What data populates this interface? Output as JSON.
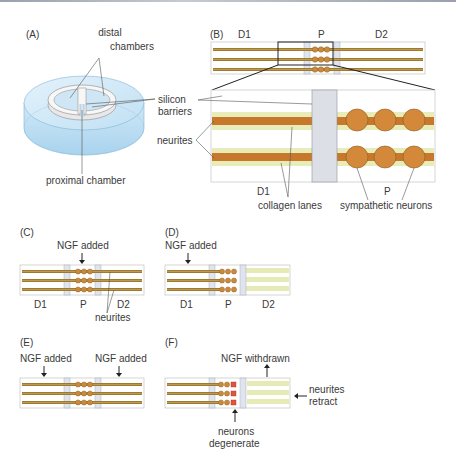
{
  "figure": {
    "panels": {
      "A": {
        "label": "(A)",
        "distal_chambers_line1": "distal",
        "distal_chambers_line2": "chambers",
        "silicon_barriers_line1": "silicon",
        "silicon_barriers_line2": "barriers",
        "proximal_chamber": "proximal chamber"
      },
      "B": {
        "label": "(B)",
        "d1": "D1",
        "p": "P",
        "d2": "D2",
        "neurites": "neurites",
        "zoom_d1": "D1",
        "zoom_p": "P",
        "collagen_lanes": "collagen lanes",
        "sympathetic_neurons": "sympathetic neurons"
      },
      "C": {
        "label": "(C)",
        "ngf_added": "NGF added",
        "d1": "D1",
        "p": "P",
        "d2": "D2",
        "neurites": "neurites"
      },
      "D": {
        "label": "(D)",
        "ngf_added": "NGF added",
        "d1": "D1",
        "p": "P",
        "d2": "D2"
      },
      "E": {
        "label": "(E)",
        "ngf_added_left": "NGF added",
        "ngf_added_right": "NGF added"
      },
      "F": {
        "label": "(F)",
        "ngf_withdrawn": "NGF withdrawn",
        "neurites_retract_line1": "neurites",
        "neurites_retract_line2": "retract",
        "neurons_degenerate_line1": "neurons",
        "neurons_degenerate_line2": "degenerate"
      }
    },
    "colors": {
      "neurite": "#c8842e",
      "neurite_thin": "#a87a2c",
      "neuron": "#d4893a",
      "collagen_lane": "#e6ebb6",
      "barrier": "#dcdfe8",
      "dish_blue": "#bfe0f2",
      "degenerating": "#e0533e"
    }
  }
}
